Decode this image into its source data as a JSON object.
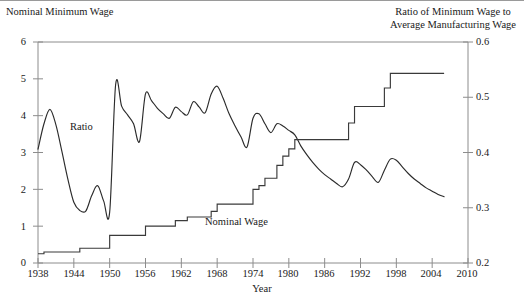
{
  "figure": {
    "left_axis_title": "Nominal Minimum Wage",
    "right_axis_title_line1": "Ratio of Minimum Wage to",
    "right_axis_title_line2": "Average Manufacturing Wage",
    "xlabel": "Year",
    "series_labels": {
      "ratio": "Ratio",
      "nominal": "Nominal Wage"
    }
  },
  "chart_data": {
    "type": "line",
    "title": "",
    "subtitle": "",
    "xlabel": "Year",
    "ylabel": "Nominal Minimum Wage",
    "y2label": "Ratio of Minimum Wage to Average Manufacturing Wage",
    "xlim": [
      1938,
      2010
    ],
    "ylim": [
      0,
      6
    ],
    "y2lim": [
      0.2,
      0.6
    ],
    "xticks": [
      1938,
      1944,
      1950,
      1956,
      1962,
      1968,
      1974,
      1980,
      1986,
      1992,
      1998,
      2004,
      2010
    ],
    "yticks": [
      0,
      1,
      2,
      3,
      4,
      5,
      6
    ],
    "y2ticks": [
      0.2,
      0.3,
      0.4,
      0.5,
      0.6
    ],
    "grid": false,
    "legend": "inline-annotations",
    "annotations": [
      {
        "text": "Ratio",
        "x": 1948.0,
        "y_left": 3.55
      },
      {
        "text": "Nominal Wage",
        "x": 1977.0,
        "y_left": 0.95
      }
    ],
    "series": [
      {
        "name": "Ratio of Minimum Wage to Average Manufacturing Wage",
        "axis": "right",
        "units": "ratio",
        "x": [
          1938,
          1939,
          1940,
          1941,
          1942,
          1943,
          1944,
          1945,
          1946,
          1947,
          1948,
          1949,
          1950,
          1951,
          1952,
          1953,
          1954,
          1955,
          1956,
          1957,
          1958,
          1959,
          1960,
          1961,
          1962,
          1963,
          1964,
          1965,
          1966,
          1967,
          1968,
          1969,
          1970,
          1971,
          1972,
          1973,
          1974,
          1975,
          1976,
          1977,
          1978,
          1979,
          1980,
          1981,
          1982,
          1983,
          1984,
          1985,
          1986,
          1987,
          1988,
          1989,
          1990,
          1991,
          1992,
          1993,
          1994,
          1995,
          1996,
          1997,
          1998,
          1999,
          2000,
          2001,
          2002,
          2003,
          2004,
          2005,
          2006
        ],
        "values_right_axis": [
          0.406,
          0.452,
          0.478,
          0.45,
          0.402,
          0.352,
          0.31,
          0.295,
          0.294,
          0.322,
          0.34,
          0.312,
          0.292,
          0.523,
          0.484,
          0.468,
          0.452,
          0.42,
          0.506,
          0.494,
          0.48,
          0.47,
          0.462,
          0.482,
          0.474,
          0.468,
          0.492,
          0.482,
          0.472,
          0.506,
          0.52,
          0.498,
          0.47,
          0.448,
          0.428,
          0.41,
          0.462,
          0.47,
          0.452,
          0.436,
          0.452,
          0.448,
          0.44,
          0.432,
          0.412,
          0.396,
          0.382,
          0.37,
          0.36,
          0.352,
          0.344,
          0.338,
          0.352,
          0.382,
          0.378,
          0.368,
          0.356,
          0.346,
          0.368,
          0.388,
          0.386,
          0.374,
          0.362,
          0.352,
          0.344,
          0.336,
          0.33,
          0.324,
          0.32
        ]
      },
      {
        "name": "Nominal Minimum Wage",
        "axis": "left",
        "units": "dollars per hour",
        "x": [
          1938,
          1939,
          1940,
          1941,
          1942,
          1943,
          1944,
          1945,
          1946,
          1947,
          1948,
          1949,
          1950,
          1951,
          1952,
          1953,
          1954,
          1955,
          1956,
          1957,
          1958,
          1959,
          1960,
          1961,
          1962,
          1963,
          1964,
          1965,
          1966,
          1967,
          1968,
          1969,
          1970,
          1971,
          1972,
          1973,
          1974,
          1975,
          1976,
          1977,
          1978,
          1979,
          1980,
          1981,
          1982,
          1983,
          1984,
          1985,
          1986,
          1987,
          1988,
          1989,
          1990,
          1991,
          1992,
          1993,
          1994,
          1995,
          1996,
          1997,
          1998,
          1999,
          2000,
          2001,
          2002,
          2003,
          2004,
          2005,
          2006
        ],
        "values_left_axis": [
          0.25,
          0.3,
          0.3,
          0.3,
          0.3,
          0.3,
          0.3,
          0.4,
          0.4,
          0.4,
          0.4,
          0.4,
          0.75,
          0.75,
          0.75,
          0.75,
          0.75,
          0.75,
          1.0,
          1.0,
          1.0,
          1.0,
          1.0,
          1.15,
          1.15,
          1.25,
          1.25,
          1.25,
          1.25,
          1.4,
          1.6,
          1.6,
          1.6,
          1.6,
          1.6,
          1.6,
          2.0,
          2.1,
          2.3,
          2.3,
          2.65,
          2.9,
          3.1,
          3.35,
          3.35,
          3.35,
          3.35,
          3.35,
          3.35,
          3.35,
          3.35,
          3.35,
          3.8,
          4.25,
          4.25,
          4.25,
          4.25,
          4.25,
          4.75,
          5.15,
          5.15,
          5.15,
          5.15,
          5.15,
          5.15,
          5.15,
          5.15,
          5.15,
          5.15
        ]
      }
    ]
  }
}
